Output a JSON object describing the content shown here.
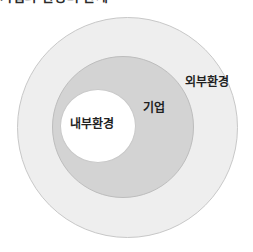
{
  "page": {
    "clipped_caption": "기업과 환경의 관계",
    "background_color": "#ffffff"
  },
  "diagram": {
    "type": "nested-circles",
    "layers": [
      {
        "id": "outer",
        "label": "외부환경",
        "fill_color": "#eeeeee",
        "stroke_color": "#c8c8c8",
        "level": 1
      },
      {
        "id": "middle",
        "label": "기업",
        "fill_color": "#d3d3d3",
        "stroke_color": "#bdbdbd",
        "level": 2
      },
      {
        "id": "inner",
        "label": "내부환경",
        "fill_color": "#ffffff",
        "stroke_color": "#c9c9c9",
        "level": 3
      }
    ]
  }
}
